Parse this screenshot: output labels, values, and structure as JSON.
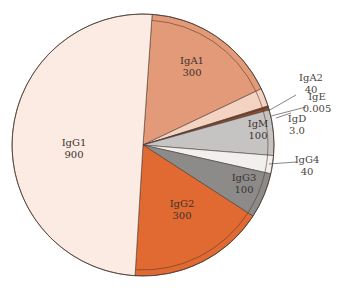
{
  "chart_data": {
    "type": "pie",
    "title": "",
    "start_angle_deg": 4,
    "direction": "clockwise",
    "slices": [
      {
        "name": "IgA1",
        "value": 300,
        "value_label": "300",
        "color": "#e39a78",
        "label_position": "inside"
      },
      {
        "name": "IgA2",
        "value": 40,
        "value_label": "40",
        "color": "#f5d3c3",
        "label_position": "outside"
      },
      {
        "name": "IgE",
        "value": 0.005,
        "value_label": "0.005",
        "color": "#8a3b1e",
        "label_position": "outside"
      },
      {
        "name": "IgD",
        "value": 3.0,
        "value_label": "3.0",
        "color": "#a04e2c",
        "label_position": "outside"
      },
      {
        "name": "IgM",
        "value": 100,
        "value_label": "100",
        "color": "#c6c4c3",
        "label_position": "inside"
      },
      {
        "name": "IgG4",
        "value": 40,
        "value_label": "40",
        "color": "#f1f0ef",
        "label_position": "outside"
      },
      {
        "name": "IgG3",
        "value": 100,
        "value_label": "100",
        "color": "#8c8b8a",
        "label_position": "inside"
      },
      {
        "name": "IgG2",
        "value": 300,
        "value_label": "300",
        "color": "#e16a32",
        "label_position": "inside"
      },
      {
        "name": "IgG1",
        "value": 900,
        "value_label": "900",
        "color": "#fcebe2",
        "label_position": "inside"
      }
    ],
    "legend": "none"
  }
}
